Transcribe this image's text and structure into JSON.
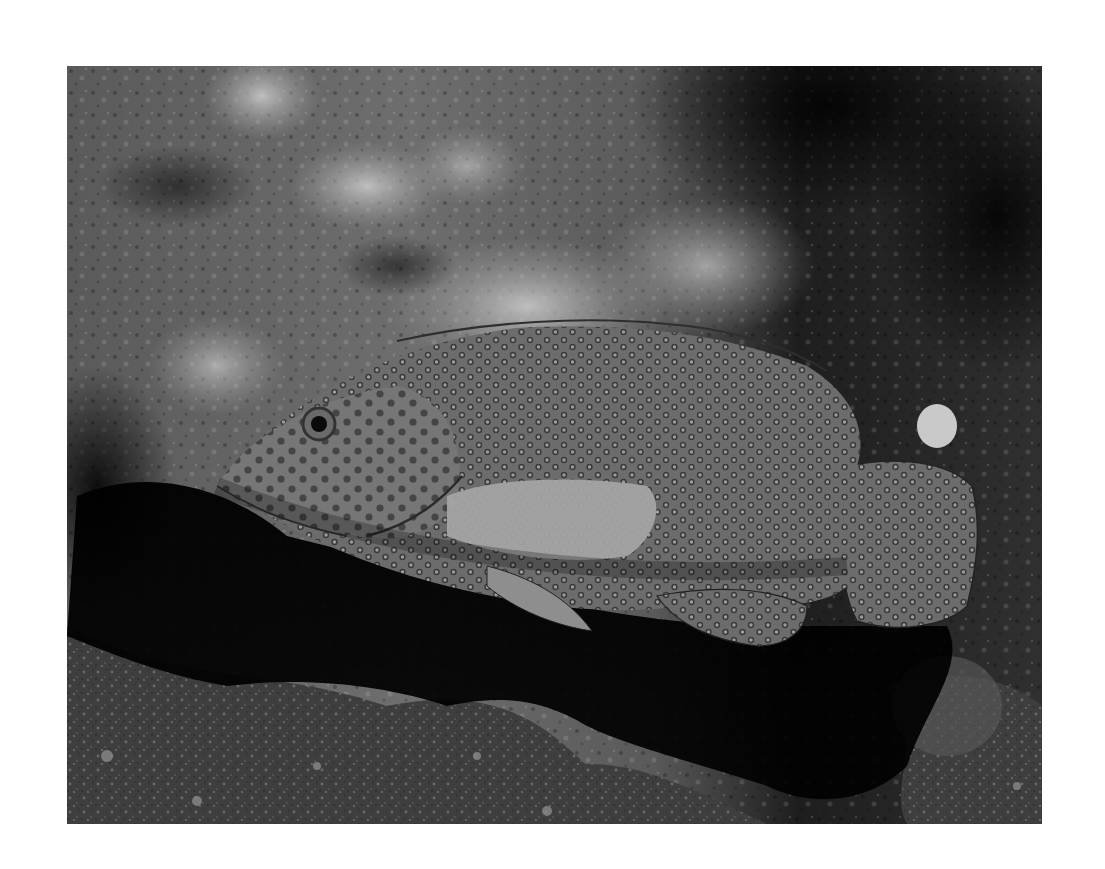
{
  "image": {
    "alt": "Grayscale underwater photograph of a spotted grouper resting beside reef rock",
    "subject": "spotted grouper (coral hind)",
    "background": "reef rock with encrusting growth, dark cave shadow beneath, gravel seafloor",
    "tone": "grayscale",
    "frame": {
      "left": 67,
      "top": 66,
      "width": 975,
      "height": 758
    },
    "colors": {
      "page": "#ffffff",
      "rock_light": "#9a9a9a",
      "rock_mid": "#5e5e5e",
      "rock_dark": "#1c1c1c",
      "shadow": "#050505",
      "fish_body": "#6f6f6f",
      "fish_spot_ring": "#3a3a3a",
      "fish_spot_center": "#9c9c9c",
      "pectoral_fin": "#a8a8a8"
    }
  }
}
